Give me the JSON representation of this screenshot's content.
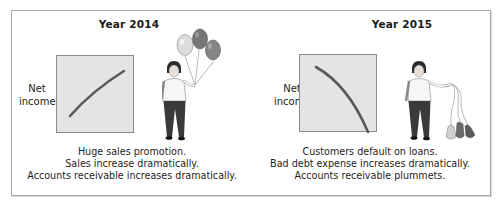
{
  "figure": {
    "panels": [
      {
        "id": "2014",
        "title": "Year 2014",
        "axis_label_line1": "Net",
        "axis_label_line2": "income",
        "trend": "increasing",
        "line_color": "#5a5a5a",
        "chart_bg": "#e4e4e4",
        "prop": "balloons-inflated",
        "balloon_colors": [
          "#d8d8d8",
          "#7a7a7a",
          "#8a8a8a"
        ],
        "caption": [
          "Huge sales promotion.",
          "Sales increase dramatically.",
          "Accounts receivable increases dramatically."
        ]
      },
      {
        "id": "2015",
        "title": "Year 2015",
        "axis_label_line1": "Net",
        "axis_label_line2": "income",
        "trend": "decreasing",
        "line_color": "#5a5a5a",
        "chart_bg": "#e4e4e4",
        "prop": "balloons-deflated",
        "balloon_colors": [
          "#cfcfcf",
          "#6a6a6a",
          "#5c5c5c"
        ],
        "caption": [
          "Customers default on loans.",
          "Bad debt expense increases dramatically.",
          "Accounts receivable plummets."
        ]
      }
    ]
  }
}
